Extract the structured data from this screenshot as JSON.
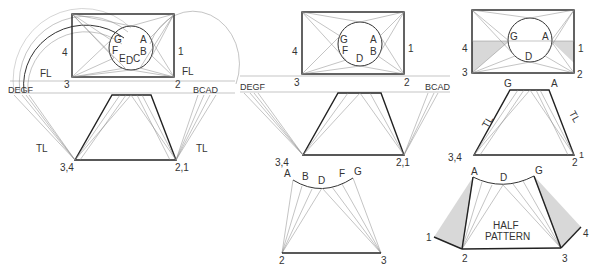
{
  "figure": {
    "panels": [
      {
        "id": "left",
        "top_view": {
          "corner_labels": [
            "4",
            "3",
            "2",
            "1"
          ],
          "circle_labels": [
            "G",
            "A",
            "F",
            "E",
            "D",
            "C",
            "B"
          ]
        },
        "labels": {
          "fl_left": "FL",
          "fl_right": "FL",
          "proj_left": "DEGF",
          "proj_right": "BCAD",
          "tl_left": "TL",
          "tl_right": "TL",
          "base_left": "3,4",
          "base_right": "2,1"
        }
      },
      {
        "id": "middle",
        "top_view": {
          "corner_labels": [
            "4",
            "3",
            "2",
            "1"
          ],
          "circle_labels": [
            "G",
            "A",
            "F",
            "B",
            "D"
          ]
        },
        "labels": {
          "proj_left": "DEGF",
          "proj_right": "BCAD",
          "base_left": "3,4",
          "base_right": "2,1"
        },
        "pattern": {
          "arc_labels": [
            "A",
            "B",
            "D",
            "F",
            "G"
          ],
          "base_left": "2",
          "base_right": "3"
        }
      },
      {
        "id": "right",
        "top_view": {
          "corner_labels": [
            "4",
            "3",
            "2",
            "1"
          ],
          "circle_labels": [
            "G",
            "A",
            "D"
          ]
        },
        "labels": {
          "top_left": "G",
          "top_right": "A",
          "tl_left": "TL",
          "tl_right": "TL",
          "base_left": "3,4",
          "base_right": "2",
          "base_right_sup": "1"
        },
        "pattern": {
          "arc_labels": [
            "A",
            "D",
            "G"
          ],
          "title_line1": "HALF",
          "title_line2": "PATTERN",
          "corner_labels": [
            "1",
            "2",
            "3",
            "4"
          ]
        }
      }
    ]
  }
}
